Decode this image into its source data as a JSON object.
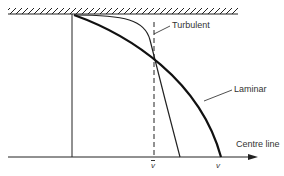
{
  "diagram": {
    "type": "velocity-profile",
    "labels": {
      "turbulent": "Turbulent",
      "laminar": "Laminar",
      "centre_line": "Centre line",
      "mean_velocity": "v",
      "max_velocity": "v"
    },
    "colors": {
      "line": "#1a1a1a",
      "text": "#333333",
      "background": "#ffffff"
    }
  }
}
